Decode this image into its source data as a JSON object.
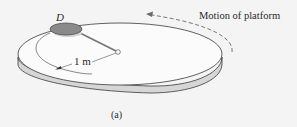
{
  "figure": {
    "caption": "(a)",
    "disk_label": "D",
    "radius_label": "1 m",
    "motion_label": "Motion of platform"
  },
  "colors": {
    "background": "#f4f4f4",
    "platform_top": "#fbfbfb",
    "platform_rim": "#d6d6d6",
    "outline": "#3a3a3a",
    "disk_fill": "#8a8a8a",
    "dashed_arrow": "#6a6a6a"
  }
}
